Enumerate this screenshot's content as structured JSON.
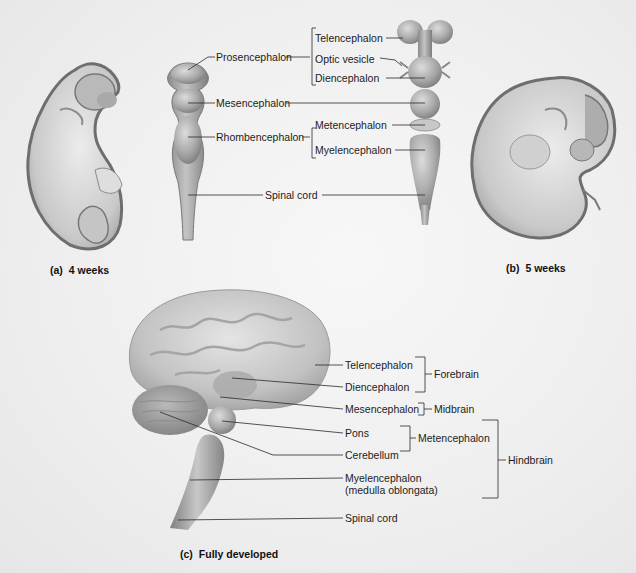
{
  "figure": {
    "panels": [
      {
        "id": "a",
        "caption_letter": "(a)",
        "caption_text": "4 weeks",
        "embryo_labels": {
          "prosencephalon": "Prosencephalon",
          "mesencephalon": "Mesencephalon",
          "rhombencephalon": "Rhombencephalon",
          "spinal_cord": "Spinal cord"
        }
      },
      {
        "id": "b",
        "caption_letter": "(b)",
        "caption_text": "5 weeks",
        "embryo_labels": {
          "telencephalon": "Telencephalon",
          "optic_vesicle": "Optic vesicle",
          "diencephalon": "Diencephalon",
          "metencephalon": "Metencephalon",
          "myelencephalon": "Myelencephalon"
        }
      },
      {
        "id": "c",
        "caption_letter": "(c)",
        "caption_text": "Fully developed",
        "structure_labels": {
          "telencephalon": "Telencephalon",
          "diencephalon": "Diencephalon",
          "mesencephalon": "Mesencephalon",
          "pons": "Pons",
          "cerebellum": "Cerebellum",
          "myelencephalon_line1": "Myelencephalon",
          "myelencephalon_line2": "(medulla oblongata)",
          "spinal_cord": "Spinal cord"
        },
        "group_labels": {
          "forebrain": "Forebrain",
          "midbrain": "Midbrain",
          "metencephalon": "Metencephalon",
          "hindbrain": "Hindbrain"
        }
      }
    ],
    "colors": {
      "tissue_light": "#d4d4d4",
      "tissue_mid": "#a8a8a8",
      "tissue_dark": "#7a7a7a",
      "line": "#2a2a2a"
    }
  }
}
